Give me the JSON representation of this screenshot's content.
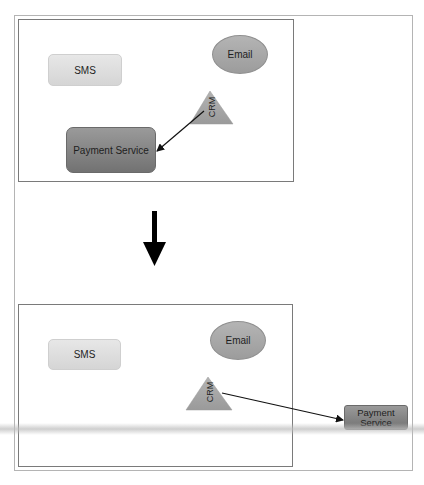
{
  "diagram": {
    "type": "architecture-before-after",
    "colors": {
      "panel_border": "#7a7a7a",
      "frame_border": "#b4b4b4",
      "light_node": "#dedede",
      "dark_node": "#808080",
      "ellipse": "#a8a8a8",
      "triangle": "#a5a5a5",
      "arrow": "#111111"
    },
    "before": {
      "nodes": {
        "sms": {
          "label": "SMS",
          "shape": "rounded-rect"
        },
        "email": {
          "label": "Email",
          "shape": "ellipse"
        },
        "crm": {
          "label": "CRM",
          "shape": "triangle"
        },
        "payment": {
          "label": "Payment Service",
          "shape": "rounded-rect"
        }
      },
      "edges": [
        {
          "from": "CRM",
          "to": "Payment Service"
        }
      ]
    },
    "transition_arrow": {
      "icon": "arrow-down-icon",
      "direction": "down"
    },
    "after": {
      "nodes": {
        "sms": {
          "label": "SMS",
          "shape": "rounded-rect"
        },
        "email": {
          "label": "Email",
          "shape": "ellipse"
        },
        "crm": {
          "label": "CRM",
          "shape": "triangle"
        },
        "payment": {
          "label": "Payment Service",
          "label_line1": "Payment",
          "label_line2": "Service",
          "shape": "rounded-rect"
        }
      },
      "edges": [
        {
          "from": "CRM",
          "to": "Payment Service"
        }
      ]
    }
  }
}
